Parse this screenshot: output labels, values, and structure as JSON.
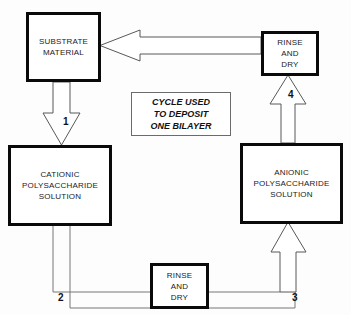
{
  "diagram": {
    "title_note": "CYCLE USED TO DEPOSIT ONE BILAYER",
    "caption_box": {
      "line1": "CYCLE USED",
      "line2": "TO DEPOSIT",
      "line3": "ONE BILAYER"
    },
    "colors": {
      "background": "#fdfdfd",
      "box_border": "#0a0a0a",
      "box_fill": "#ffffff",
      "arrow_stroke": "#585858",
      "connector_stroke": "#767676",
      "text": "#1a1a1a",
      "caption_border": "#6b6b6b"
    },
    "nodes": [
      {
        "id": "substrate",
        "line1": "SUBSTRATE",
        "line2": "MATERIAL"
      },
      {
        "id": "cationic",
        "line1": "CATIONIC",
        "line2": "POLYSACCHARIDE",
        "line3": "SOLUTION"
      },
      {
        "id": "anionic",
        "line1": "ANIONIC",
        "line2": "POLYSACCHARIDE",
        "line3": "SOLUTION"
      },
      {
        "id": "rinse-top",
        "line1": "RINSE",
        "line2": "AND",
        "line3": "DRY"
      },
      {
        "id": "rinse-bottom",
        "line1": "RINSE",
        "line2": "AND",
        "line3": "DRY"
      }
    ],
    "steps": [
      {
        "number": "1",
        "from": "substrate",
        "to": "cationic",
        "direction": "down"
      },
      {
        "number": "2",
        "from": "cationic",
        "to": "rinse-bottom",
        "direction": "right"
      },
      {
        "number": "3",
        "from": "rinse-bottom",
        "to": "anionic",
        "direction": "up"
      },
      {
        "number": "4",
        "from": "anionic",
        "to": "rinse-top",
        "direction": "up"
      },
      {
        "number": "",
        "from": "rinse-top",
        "to": "substrate",
        "direction": "left"
      }
    ]
  }
}
